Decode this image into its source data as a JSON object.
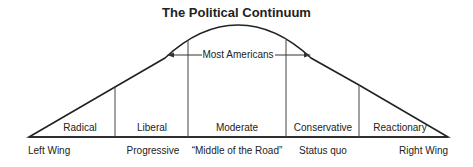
{
  "title": "The Political Continuum",
  "arrow_label": "Most Americans",
  "segments": [
    {
      "label": "Radical",
      "x": 80
    },
    {
      "label": "Liberal",
      "x": 152
    },
    {
      "label": "Moderate",
      "x": 237
    },
    {
      "label": "Conservative",
      "x": 323
    },
    {
      "label": "Reactionary",
      "x": 400
    }
  ],
  "bottom_labels": [
    {
      "label": "Left Wing"
    },
    {
      "label": "Progressive"
    },
    {
      "label": "“Middle of the Road”"
    },
    {
      "label": "Status quo"
    },
    {
      "label": "Right Wing"
    }
  ]
}
